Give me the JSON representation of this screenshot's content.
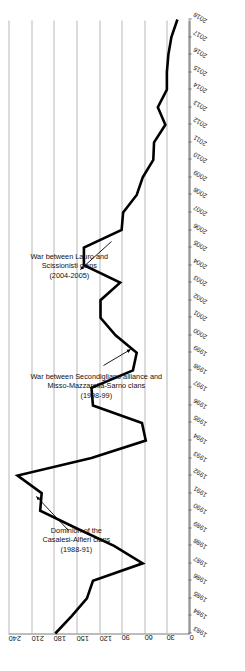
{
  "chart_data": {
    "type": "line",
    "title": "",
    "subtitle": "",
    "xlabel": "",
    "ylabel": "",
    "xlim": [
      1983,
      2018
    ],
    "ylim": [
      0,
      240
    ],
    "ytick_values": [
      0,
      30,
      60,
      90,
      120,
      150,
      180,
      210,
      240
    ],
    "ytick_labels": [
      "0",
      "30",
      "60",
      "90",
      "120",
      "150",
      "180",
      "210",
      "240"
    ],
    "grid": "major-y",
    "legend": "none",
    "line_color": "#000000",
    "line_width": 2.6,
    "x": [
      1983,
      1984,
      1985,
      1986,
      1987,
      1988,
      1989,
      1990,
      1991,
      1992,
      1993,
      1994,
      1995,
      1996,
      1997,
      1998,
      1999,
      2000,
      2001,
      2002,
      2003,
      2004,
      2005,
      2006,
      2007,
      2008,
      2009,
      2010,
      2011,
      2012,
      2013,
      2014,
      2015,
      2016,
      2017,
      2018
    ],
    "xtick_labels": [
      "1983",
      "1984",
      "1985",
      "1986",
      "1987",
      "1988",
      "1989",
      "1990",
      "1991",
      "1992",
      "1993",
      "1994",
      "1995",
      "1996",
      "1997",
      "1998",
      "1999",
      "2000",
      "2001",
      "2002",
      "2003",
      "2004",
      "2005",
      "2006",
      "2007",
      "2008",
      "2009",
      "2010",
      "2011",
      "2012",
      "2013",
      "2014",
      "2015",
      "2016",
      "2017",
      "2018"
    ],
    "series": [
      {
        "name": "Camorra homicides",
        "values": [
          178,
          156,
          136,
          128,
          62,
          100,
          150,
          198,
          196,
          228,
          130,
          58,
          63,
          128,
          130,
          75,
          70,
          98,
          118,
          118,
          92,
          140,
          140,
          90,
          88,
          70,
          62,
          48,
          47,
          32,
          42,
          30,
          30,
          28,
          24,
          16
        ]
      }
    ],
    "annotations": [
      {
        "id": "ann-casalesi",
        "lines": [
          "Dominion of the",
          "Casalesi-Alfieri clans",
          "(1988-91)"
        ],
        "points_to_year": 1991,
        "points_to_value": 196
      },
      {
        "id": "ann-secondigliano",
        "lines": [
          "War between Secondigliano alliance and",
          "Misso-Mazzarella-Sarno clans",
          "(1998-99)"
        ],
        "points_to_year": 1999,
        "points_to_value": 70
      },
      {
        "id": "ann-lauro",
        "lines": [
          "War between Lauro and",
          "Scissionisti clans",
          "(2004-2005)"
        ],
        "points_to_year": 2004,
        "points_to_value": 140
      }
    ]
  }
}
